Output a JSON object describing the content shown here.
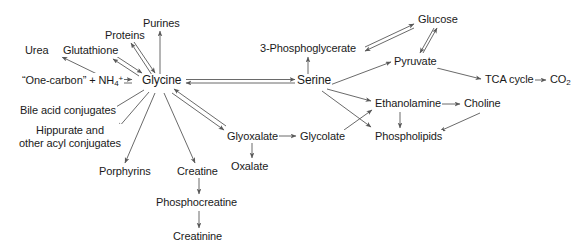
{
  "figure": {
    "background_color": "#ffffff",
    "line_color": "#595959",
    "text_color": "#1a1a1a",
    "width": 587,
    "height": 251
  },
  "nodes": {
    "urea": "Urea",
    "glutathione": "Glutathione",
    "proteins": "Proteins",
    "purines": "Purines",
    "one_carbon_pre": "“One-carbon” + NH",
    "one_carbon_sub": "4",
    "one_carbon_sup": "+",
    "glycine": "Glycine",
    "bile_acid_conjugates": "Bile acid conjugates",
    "hippurate_line1": "Hippurate and",
    "hippurate_line2": "other acyl conjugates",
    "porphyrins": "Porphyrins",
    "creatine": "Creatine",
    "phosphocreatine": "Phosphocreatine",
    "creatinine": "Creatinine",
    "glyoxalate": "Glyoxalate",
    "oxalate": "Oxalate",
    "glycolate": "Glycolate",
    "serine": "Serine",
    "phosphoglycerate": "3-Phosphoglycerate",
    "glucose": "Glucose",
    "pyruvate": "Pyruvate",
    "tca_cycle": "TCA cycle",
    "co2_pre": "CO",
    "co2_sub": "2",
    "ethanolamine": "Ethanolamine",
    "choline": "Choline",
    "phospholipids": "Phospholipids"
  },
  "edges": [
    {
      "from": "one_carbon",
      "to": "glycine",
      "style": "double-headed"
    },
    {
      "from": "glycine",
      "to": "glutathione",
      "style": "double-headed"
    },
    {
      "from": "glycine",
      "to": "proteins",
      "style": "double-headed"
    },
    {
      "from": "glycine",
      "to": "purines",
      "style": "single"
    },
    {
      "from": "one_carbon",
      "to": "urea",
      "style": "single"
    },
    {
      "from": "glycine",
      "to": "bile_acid_conjugates",
      "style": "single"
    },
    {
      "from": "glycine",
      "to": "hippurate",
      "style": "single"
    },
    {
      "from": "glycine",
      "to": "porphyrins",
      "style": "single"
    },
    {
      "from": "glycine",
      "to": "creatine",
      "style": "single"
    },
    {
      "from": "creatine",
      "to": "phosphocreatine",
      "style": "single"
    },
    {
      "from": "phosphocreatine",
      "to": "creatinine",
      "style": "single"
    },
    {
      "from": "glycine",
      "to": "glyoxalate",
      "style": "double-headed"
    },
    {
      "from": "glyoxalate",
      "to": "oxalate",
      "style": "single"
    },
    {
      "from": "glyoxalate",
      "to": "glycolate",
      "style": "single"
    },
    {
      "from": "glycine",
      "to": "serine",
      "style": "double-headed"
    },
    {
      "from": "serine",
      "to": "phosphoglycerate",
      "style": "single"
    },
    {
      "from": "phosphoglycerate",
      "to": "glucose",
      "style": "double-headed"
    },
    {
      "from": "glucose",
      "to": "pyruvate",
      "style": "double-headed"
    },
    {
      "from": "serine",
      "to": "pyruvate",
      "style": "single"
    },
    {
      "from": "pyruvate",
      "to": "tca_cycle",
      "style": "single"
    },
    {
      "from": "tca_cycle",
      "to": "co2",
      "style": "single"
    },
    {
      "from": "serine",
      "to": "ethanolamine",
      "style": "single"
    },
    {
      "from": "serine",
      "to": "phospholipids",
      "style": "single"
    },
    {
      "from": "ethanolamine",
      "to": "choline",
      "style": "single"
    },
    {
      "from": "ethanolamine",
      "to": "phospholipids",
      "style": "single"
    },
    {
      "from": "choline",
      "to": "phospholipids",
      "style": "single"
    },
    {
      "from": "glycolate",
      "to": "ethanolamine",
      "style": "single"
    }
  ]
}
